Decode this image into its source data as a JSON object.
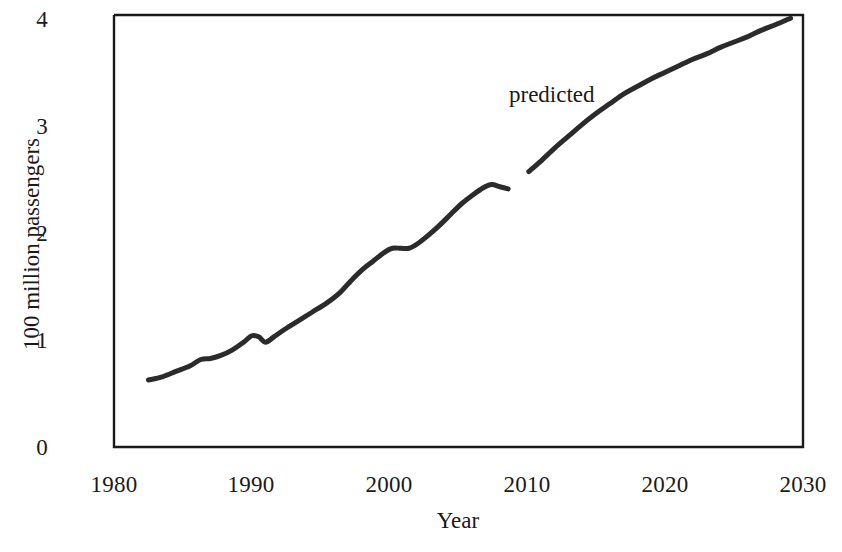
{
  "chart_data": {
    "type": "line",
    "title": "",
    "xlabel": "Year",
    "ylabel": "100 million passengers",
    "xlim": [
      1980,
      2030
    ],
    "ylim": [
      0,
      4
    ],
    "grid": false,
    "legend": "none",
    "background_color": "#ffffff",
    "line_color": "#2b2b2b",
    "axis_color": "#1a1a1a",
    "xticks": [
      1980,
      1990,
      2000,
      2010,
      2020,
      2030
    ],
    "xtick_labels": [
      "1980",
      "1990",
      "2000",
      "2010",
      "2020",
      "2030"
    ],
    "yticks": [
      0,
      1,
      2,
      3,
      4
    ],
    "ytick_labels": [
      "0",
      "1",
      "2",
      "3",
      "4"
    ],
    "annotations": [
      {
        "text": "predicted",
        "x": 2009.0,
        "y": 3.3
      }
    ],
    "series": [
      {
        "name": "historical",
        "style": "solid",
        "x": [
          1982.5,
          1983.5,
          1984.5,
          1985.5,
          1986.3,
          1987.0,
          1987.8,
          1988.6,
          1989.4,
          1990.0,
          1990.5,
          1991.0,
          1991.6,
          1992.4,
          1993.4,
          1994.4,
          1995.4,
          1996.4,
          1997.2,
          1998.0,
          1998.8,
          1999.6,
          2000.2,
          2000.8,
          2001.4,
          2002.0,
          2002.8,
          2003.6,
          2004.4,
          2005.2,
          2006.0,
          2006.8,
          2007.4,
          2008.0,
          2008.6
        ],
        "y": [
          0.62,
          0.65,
          0.7,
          0.75,
          0.81,
          0.82,
          0.85,
          0.9,
          0.97,
          1.03,
          1.02,
          0.97,
          1.02,
          1.09,
          1.17,
          1.25,
          1.33,
          1.43,
          1.54,
          1.64,
          1.72,
          1.8,
          1.84,
          1.84,
          1.84,
          1.88,
          1.96,
          2.05,
          2.15,
          2.25,
          2.33,
          2.4,
          2.43,
          2.41,
          2.39
        ]
      },
      {
        "name": "predicted",
        "style": "solid",
        "x": [
          2010.1,
          2011.0,
          2012.0,
          2013.0,
          2014.0,
          2015.0,
          2016.0,
          2017.0,
          2018.0,
          2019.0,
          2020.0,
          2021.0,
          2022.0,
          2023.0,
          2024.0,
          2025.0,
          2026.0,
          2027.0,
          2028.0,
          2029.1
        ],
        "y": [
          2.55,
          2.65,
          2.77,
          2.88,
          2.99,
          3.09,
          3.18,
          3.27,
          3.34,
          3.41,
          3.47,
          3.53,
          3.59,
          3.64,
          3.7,
          3.75,
          3.8,
          3.86,
          3.91,
          3.97
        ]
      }
    ]
  },
  "axes": {
    "x_title": "Year",
    "y_title": "100 million passengers"
  }
}
